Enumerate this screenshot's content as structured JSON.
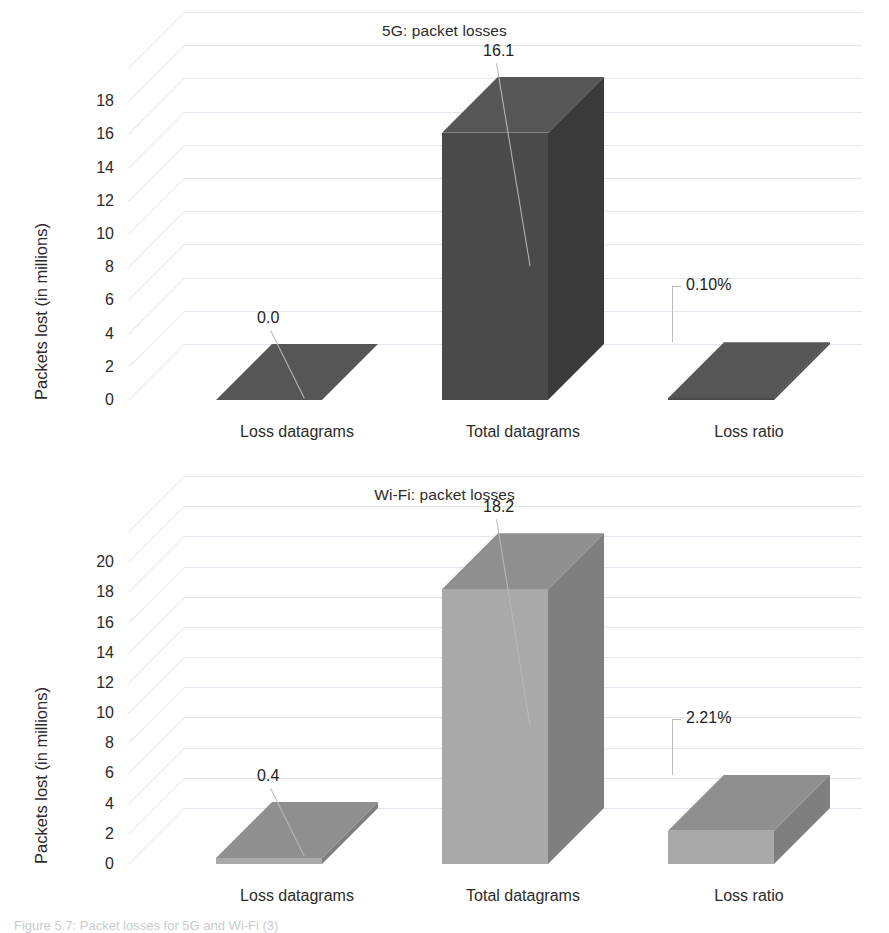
{
  "caption": "Figure 5.7: Packet losses for 5G and Wi-Fi (3)",
  "charts": [
    {
      "id": "chart-5g",
      "title": "5G: packet losses",
      "ylabel": "Packets lost (in millions)",
      "ticks": [
        "0",
        "2",
        "4",
        "6",
        "8",
        "10",
        "12",
        "14",
        "16",
        "18"
      ],
      "categories": [
        "Loss datagrams",
        "Total datagrams",
        "Loss ratio"
      ],
      "labels": [
        "0.0",
        "16.1",
        "0.10%"
      ],
      "values": [
        0.0,
        16.1,
        0.1
      ],
      "colors": {
        "front": "#4a4a4a",
        "top": "#565656",
        "side": "#3b3b3b"
      }
    },
    {
      "id": "chart-wifi",
      "title": "Wi-Fi: packet losses",
      "ylabel": "Packets lost (in millions)",
      "ticks": [
        "0",
        "2",
        "4",
        "6",
        "8",
        "10",
        "12",
        "14",
        "16",
        "18",
        "20"
      ],
      "categories": [
        "Loss datagrams",
        "Total datagrams",
        "Loss ratio"
      ],
      "labels": [
        "0.4",
        "18.2",
        "2.21%"
      ],
      "values": [
        0.4,
        18.2,
        2.21
      ],
      "colors": {
        "front": "#a9a9a9",
        "top": "#8f8f8f",
        "side": "#7f7f7f"
      }
    }
  ],
  "chart_data": [
    {
      "type": "bar",
      "title": "5G: packet losses",
      "xlabel": "",
      "ylabel": "Packets lost (in millions)",
      "categories": [
        "Loss datagrams",
        "Total datagrams",
        "Loss ratio"
      ],
      "values": [
        0.0,
        16.1,
        0.1
      ],
      "data_labels": [
        "0.0",
        "16.1",
        "0.10%"
      ],
      "ytick_labels": [
        "0",
        "2",
        "4",
        "6",
        "8",
        "10",
        "12",
        "14",
        "16",
        "18"
      ],
      "ylim": [
        0,
        19.5
      ],
      "grid": true,
      "legend": "none",
      "series_color": "#4a4a4a",
      "note": "3-D column chart; 'Loss ratio' value is a percentage (0.10%) plotted on the same axis and renders as a near-zero column."
    },
    {
      "type": "bar",
      "title": "Wi-Fi: packet losses",
      "xlabel": "",
      "ylabel": "Packets lost (in millions)",
      "categories": [
        "Loss datagrams",
        "Total datagrams",
        "Loss ratio"
      ],
      "values": [
        0.4,
        18.2,
        2.21
      ],
      "data_labels": [
        "0.4",
        "18.2",
        "2.21%"
      ],
      "ytick_labels": [
        "0",
        "2",
        "4",
        "6",
        "8",
        "10",
        "12",
        "14",
        "16",
        "18",
        "20"
      ],
      "ylim": [
        0,
        21.5
      ],
      "grid": true,
      "legend": "none",
      "series_color": "#a9a9a9",
      "note": "3-D column chart; 'Loss ratio' value is a percentage (2.21%) plotted on the same axis and renders as a near-zero column."
    }
  ]
}
